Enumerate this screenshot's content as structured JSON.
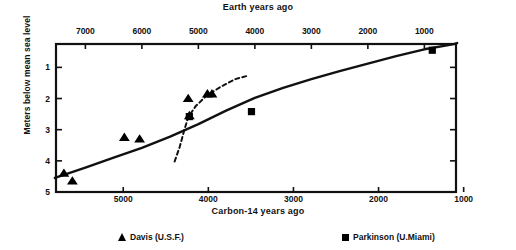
{
  "chart_data": {
    "type": "scatter",
    "title": "",
    "xlabel": "Carbon-14 years ago",
    "xlabel_top": "Earth years ago",
    "ylabel": "Meters below mean sea level",
    "grid": false,
    "legend_position": "bottom",
    "axes": {
      "top": {
        "label": "Earth years ago",
        "ticks": [
          7000,
          6000,
          5000,
          4000,
          3000,
          2000,
          1000
        ],
        "tick_labels": [
          "7000",
          "6000",
          "5000",
          "4000",
          "3000",
          "2000",
          "1000"
        ],
        "range": [
          7520,
          440
        ],
        "direction": "reversed"
      },
      "bottom": {
        "label": "Carbon-14 years ago",
        "ticks": [
          5000,
          4000,
          3000,
          2000,
          1000
        ],
        "tick_labels": [
          "5000",
          "4000",
          "3000",
          "2000",
          "1000"
        ],
        "range": [
          5790,
          1090
        ],
        "direction": "reversed"
      },
      "left": {
        "label": "Meters below mean sea level",
        "ticks": [
          1,
          2,
          3,
          4,
          5
        ],
        "tick_labels": [
          "1",
          "2",
          "3",
          "4",
          "5"
        ],
        "range": [
          0.25,
          5.0
        ],
        "direction": "inverted"
      },
      "right": {
        "ticks": [
          1,
          2,
          3,
          4,
          5
        ],
        "tick_labels": [
          "",
          "",
          "",
          "",
          ""
        ]
      }
    },
    "series": [
      {
        "name": "Davis (U.S.F.)",
        "marker": "triangle",
        "color": "#000000",
        "points": [
          {
            "x_earth": 7380,
            "y": 4.4
          },
          {
            "x_earth": 7230,
            "y": 4.65
          },
          {
            "x_earth": 6310,
            "y": 3.25
          },
          {
            "x_earth": 6040,
            "y": 3.3
          },
          {
            "x_earth": 5180,
            "y": 2.0
          },
          {
            "x_earth": 5160,
            "y": 2.55
          },
          {
            "x_earth": 4840,
            "y": 1.85
          },
          {
            "x_earth": 4760,
            "y": 1.85
          }
        ]
      },
      {
        "name": "Parkinson (U.Miami)",
        "marker": "square",
        "color": "#000000",
        "points": [
          {
            "x_earth": 5160,
            "y": 2.58
          },
          {
            "x_earth": 4060,
            "y": 2.42
          },
          {
            "x_earth": 860,
            "y": 0.45
          }
        ]
      }
    ],
    "curves": [
      {
        "name": "sea-level-curve-solid",
        "style": "solid",
        "points": [
          {
            "x_earth": 7540,
            "y": 4.55
          },
          {
            "x_earth": 7000,
            "y": 4.22
          },
          {
            "x_earth": 6500,
            "y": 3.9
          },
          {
            "x_earth": 6000,
            "y": 3.58
          },
          {
            "x_earth": 5500,
            "y": 3.22
          },
          {
            "x_earth": 5000,
            "y": 2.82
          },
          {
            "x_earth": 4500,
            "y": 2.38
          },
          {
            "x_earth": 4000,
            "y": 1.98
          },
          {
            "x_earth": 3500,
            "y": 1.66
          },
          {
            "x_earth": 3000,
            "y": 1.38
          },
          {
            "x_earth": 2500,
            "y": 1.12
          },
          {
            "x_earth": 2000,
            "y": 0.88
          },
          {
            "x_earth": 1500,
            "y": 0.64
          },
          {
            "x_earth": 1000,
            "y": 0.42
          },
          {
            "x_earth": 500,
            "y": 0.26
          },
          {
            "x_earth": 420,
            "y": 0.22
          }
        ]
      },
      {
        "name": "sea-level-curve-dashed",
        "style": "dashed",
        "points": [
          {
            "x_earth": 5420,
            "y": 4.02
          },
          {
            "x_earth": 5330,
            "y": 3.55
          },
          {
            "x_earth": 5250,
            "y": 3.02
          },
          {
            "x_earth": 5180,
            "y": 2.6
          },
          {
            "x_earth": 5050,
            "y": 2.25
          },
          {
            "x_earth": 4850,
            "y": 1.9
          },
          {
            "x_earth": 4600,
            "y": 1.62
          },
          {
            "x_earth": 4350,
            "y": 1.38
          },
          {
            "x_earth": 4150,
            "y": 1.28
          }
        ]
      }
    ],
    "legend": [
      {
        "label": "Davis (U.S.F.)",
        "marker": "triangle"
      },
      {
        "label": "Parkinson (U.Miami)",
        "marker": "square"
      }
    ]
  },
  "legend": {
    "davis": "Davis (U.S.F.)",
    "parkinson": "Parkinson (U.Miami)"
  },
  "labels": {
    "top_title": "Earth years ago",
    "bottom_title": "Carbon-14 years ago",
    "y_title": "Meters below mean sea level",
    "top_ticks": [
      "7000",
      "6000",
      "5000",
      "4000",
      "3000",
      "2000",
      "1000"
    ],
    "bottom_ticks": [
      "5000",
      "4000",
      "3000",
      "2000",
      "1000"
    ],
    "y_ticks": [
      "1",
      "2",
      "3",
      "4",
      "5"
    ]
  }
}
